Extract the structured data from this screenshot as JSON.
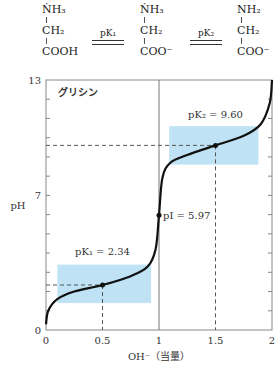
{
  "species": [
    {
      "top": "ṄH₃",
      "mid": "CH₂",
      "bottom": "COOH"
    },
    {
      "top": "ṄH₃",
      "mid": "CH₂",
      "bottom": "COO⁻"
    },
    {
      "top": "NH₂",
      "mid": "CH₂",
      "bottom": "COO⁻"
    }
  ],
  "equilibria": [
    {
      "label": "pK₁"
    },
    {
      "label": "pK₂"
    }
  ],
  "chart_data": {
    "type": "line",
    "title": "グリシン",
    "xlabel": "OH⁻（当量）",
    "ylabel": "pH",
    "xlim": [
      0,
      2
    ],
    "ylim": [
      0,
      13
    ],
    "x_ticks": [
      "0",
      "0.5",
      "1",
      "1.5",
      "2"
    ],
    "y_tick_labels": [
      "0",
      "7",
      "13"
    ],
    "grid": false,
    "series": [
      {
        "name": "glycine titration",
        "x": [
          0,
          0.02,
          0.1,
          0.25,
          0.5,
          0.75,
          0.9,
          0.97,
          1.0,
          1.03,
          1.1,
          1.25,
          1.5,
          1.75,
          1.9,
          1.98,
          2.0
        ],
        "y": [
          0.3,
          1.0,
          1.6,
          2.0,
          2.34,
          2.8,
          3.3,
          4.2,
          5.97,
          7.9,
          8.7,
          9.1,
          9.6,
          10.1,
          10.7,
          11.8,
          13.0
        ]
      }
    ],
    "annotations": [
      {
        "text": "pK₁ = 2.34",
        "x": 0.5,
        "y": 2.34
      },
      {
        "text": "pI = 5.97",
        "x": 1.0,
        "y": 5.97
      },
      {
        "text": "pK₂ = 9.60",
        "x": 1.5,
        "y": 9.6
      }
    ],
    "buffer_regions": [
      {
        "x": [
          0.1,
          0.93
        ],
        "y": [
          1.4,
          3.4
        ]
      },
      {
        "x": [
          1.09,
          1.88
        ],
        "y": [
          8.6,
          10.6
        ]
      }
    ],
    "colors": {
      "curve": "#111111",
      "buffer": "#bfe3f5",
      "axis": "#888888"
    }
  }
}
